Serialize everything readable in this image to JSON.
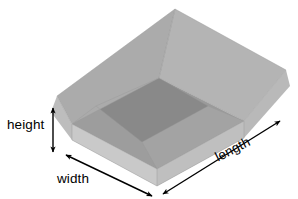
{
  "diagram": {
    "background_color": "#ffffff",
    "labels": {
      "height": "height",
      "width": "width",
      "length": "length"
    },
    "arrows": {
      "height_arrow": "vertical-double-headed-arrow",
      "width_arrow": "diagonal-double-headed-arrow",
      "length_arrow": "diagonal-double-headed-arrow"
    },
    "colors": {
      "flap_left_outer": "#bcbcbc",
      "flap_left_under": "#a8a8a8",
      "flap_rear_left": "#a9a9a9",
      "flap_rear_right": "#b2b2b2",
      "flap_right_outer": "#b6b6b6",
      "flap_front": "#c4c4c4",
      "interior_floor": "#8a8a8a",
      "interior_wall_left": "#9b9b9b",
      "interior_wall_back": "#929292",
      "interior_wall_right": "#a0a0a0",
      "outer_face_front": "#d2d2d2",
      "outer_face_side": "#c8c8c8",
      "rim_edge": "#bfbfbf",
      "arrow_color": "#000000",
      "text_color": "#000000"
    },
    "icons": {
      "height_arrow_icon": "arrow-up-down-icon",
      "width_arrow_icon": "arrow-diagonal-icon",
      "length_arrow_icon": "arrow-diagonal-icon"
    }
  }
}
